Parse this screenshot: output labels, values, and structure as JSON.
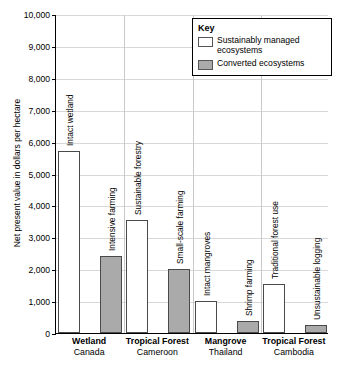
{
  "chart_data": {
    "type": "bar",
    "title": "",
    "xlabel": "",
    "ylabel": "Net present value in dollars per hectare",
    "ylim": [
      0,
      10000
    ],
    "ytick_step": 1000,
    "ytick_labels": [
      "10,000",
      "9,000",
      "8,000",
      "7,000",
      "6,000",
      "5,000",
      "4,000",
      "3,000",
      "2,000",
      "1,000",
      "0"
    ],
    "grid": true,
    "legend": {
      "title": "Key",
      "position": "top-right",
      "entries": [
        {
          "label": "Sustainably managed ecosystems",
          "color": "#ffffff"
        },
        {
          "label": "Converted ecosystems",
          "color": "#aaaaaa"
        }
      ]
    },
    "categories": [
      {
        "name": "Wetland",
        "country": "Canada"
      },
      {
        "name": "Tropical Forest",
        "country": "Cameroon"
      },
      {
        "name": "Mangrove",
        "country": "Thailand"
      },
      {
        "name": "Tropical Forest",
        "country": "Cambodia"
      }
    ],
    "bars": [
      {
        "group": 0,
        "label": "Intact wetland",
        "value": 5700,
        "series": "Sustainably managed ecosystems"
      },
      {
        "group": 0,
        "label": "Intensive farming",
        "value": 2400,
        "series": "Converted ecosystems"
      },
      {
        "group": 1,
        "label": "Sustainable forestry",
        "value": 3550,
        "series": "Sustainably managed ecosystems"
      },
      {
        "group": 1,
        "label": "Small-scale farming",
        "value": 2000,
        "series": "Converted ecosystems"
      },
      {
        "group": 2,
        "label": "Intact mangroves",
        "value": 1000,
        "series": "Sustainably managed ecosystems"
      },
      {
        "group": 2,
        "label": "Shrimp farming",
        "value": 380,
        "series": "Converted ecosystems"
      },
      {
        "group": 3,
        "label": "Traditional forest use",
        "value": 1530,
        "series": "Sustainably managed ecosystems"
      },
      {
        "group": 3,
        "label": "Unsustainable logging",
        "value": 250,
        "series": "Converted ecosystems"
      }
    ]
  }
}
